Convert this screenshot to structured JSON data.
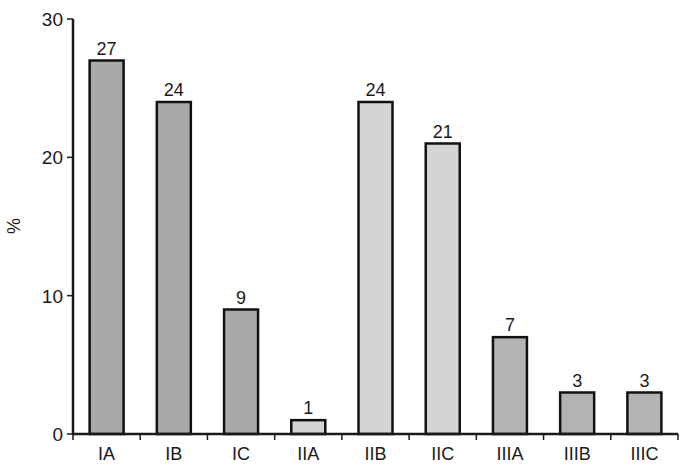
{
  "chart_data": {
    "type": "bar",
    "title": "",
    "xlabel": "",
    "ylabel": "%",
    "ylim": [
      0,
      30
    ],
    "yticks": [
      0,
      10,
      20,
      30
    ],
    "grid": false,
    "legend": null,
    "categories": [
      "IA",
      "IB",
      "IC",
      "IIA",
      "IIB",
      "IIC",
      "IIIA",
      "IIIB",
      "IIIC"
    ],
    "values": [
      27,
      24,
      9,
      1,
      24,
      21,
      7,
      3,
      3
    ],
    "data_labels": [
      "27",
      "24",
      "9",
      "1",
      "24",
      "21",
      "7",
      "3",
      "3"
    ],
    "bar_colors": [
      "#a9a9a9",
      "#a9a9a9",
      "#a9a9a9",
      "#d4d4d4",
      "#d4d4d4",
      "#d4d4d4",
      "#b3b3b3",
      "#b3b3b3",
      "#b3b3b3"
    ]
  },
  "colors": {
    "axis": "#1a1a1a",
    "bar_outline": "#111111",
    "text": "#1a1a1a"
  }
}
